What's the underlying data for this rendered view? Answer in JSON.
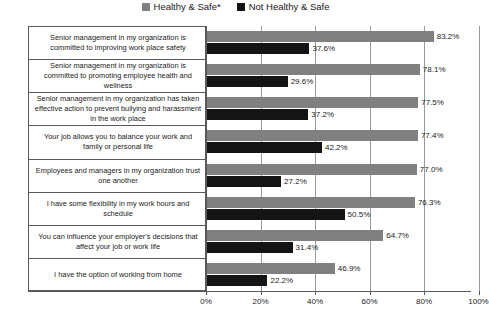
{
  "legend": {
    "position": "top-center",
    "entries": [
      {
        "label": "Healthy & Safe*",
        "color": "#808080",
        "swatch_name": "legend-swatch-healthy-safe"
      },
      {
        "label": "Not Healthy & Safe",
        "color": "#141414",
        "swatch_name": "legend-swatch-not-healthy-safe"
      }
    ]
  },
  "chart_data": {
    "type": "bar",
    "orientation": "horizontal",
    "title": "",
    "subtitle": "",
    "xlabel": "",
    "ylabel": "",
    "xlim": [
      0,
      100
    ],
    "xtick_labels": [
      "0%",
      "20%",
      "40%",
      "60%",
      "80%",
      "100%"
    ],
    "xticks": [
      0,
      20,
      40,
      60,
      80,
      100
    ],
    "grid": true,
    "grid_axis": "x",
    "legend_position": "top-center",
    "categories": [
      "Senior management in my organization is committed to improving work place safety",
      "Senior management in my organization is committed to promoting employee health and wellness",
      "Senior management in my organization has taken effective action to prevent bullying and harassment in the work place",
      "Your job allows you to balance your work and family or personal life",
      "Employees and managers in my organization trust one another",
      "I have some flexibility in my work hours and schedule",
      "You can influence your employer's decisions that affect your job or work life",
      "I have the option of working from home"
    ],
    "series": [
      {
        "name": "Healthy & Safe*",
        "color": "#808080",
        "values": [
          83.2,
          78.1,
          77.5,
          77.4,
          77.0,
          76.3,
          64.7,
          46.9
        ],
        "labels": [
          "83.2%",
          "78.1%",
          "77.5%",
          "77.4%",
          "77.0%",
          "76.3%",
          "64.7%",
          "46.9%"
        ]
      },
      {
        "name": "Not Healthy & Safe",
        "color": "#141414",
        "values": [
          37.6,
          29.6,
          37.2,
          42.2,
          27.2,
          50.5,
          31.4,
          22.2
        ],
        "labels": [
          "37.6%",
          "29.6%",
          "37.2%",
          "42.2%",
          "27.2%",
          "50.5%",
          "31.4%",
          "22.2%"
        ]
      }
    ]
  }
}
